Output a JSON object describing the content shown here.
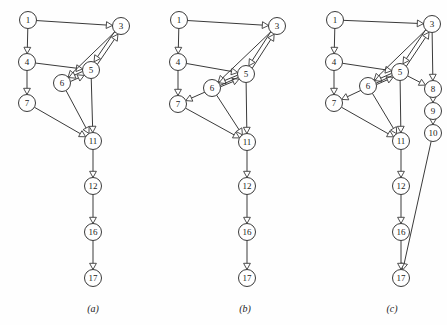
{
  "figure": {
    "background_color": "#fefefe",
    "stroke_color": "#3a3a3a",
    "node_fill": "#ffffff",
    "node_radius": 8.5,
    "width": 447,
    "height": 325
  },
  "panels": [
    {
      "id": "panel-a",
      "caption": "(a)",
      "caption_x": 93,
      "caption_y": 312,
      "nodes": [
        {
          "label": "1",
          "x": 28,
          "y": 20
        },
        {
          "label": "3",
          "x": 121,
          "y": 26
        },
        {
          "label": "4",
          "x": 27,
          "y": 62
        },
        {
          "label": "5",
          "x": 91,
          "y": 70
        },
        {
          "label": "6",
          "x": 62,
          "y": 83
        },
        {
          "label": "7",
          "x": 27,
          "y": 103
        },
        {
          "label": "11",
          "x": 93,
          "y": 141
        },
        {
          "label": "12",
          "x": 93,
          "y": 186
        },
        {
          "label": "16",
          "x": 93,
          "y": 232
        },
        {
          "label": "17",
          "x": 93,
          "y": 278
        }
      ],
      "edges": [
        {
          "from": "1",
          "to": "3"
        },
        {
          "from": "1",
          "to": "4"
        },
        {
          "from": "4",
          "to": "5"
        },
        {
          "from": "4",
          "to": "7"
        },
        {
          "from": "3",
          "to": "5"
        },
        {
          "from": "3",
          "to": "6"
        },
        {
          "from": "5",
          "to": "3"
        },
        {
          "from": "5",
          "to": "6"
        },
        {
          "from": "6",
          "to": "5"
        },
        {
          "from": "5",
          "to": "11"
        },
        {
          "from": "6",
          "to": "11"
        },
        {
          "from": "7",
          "to": "11"
        },
        {
          "from": "11",
          "to": "12"
        },
        {
          "from": "12",
          "to": "16"
        },
        {
          "from": "16",
          "to": "17"
        }
      ]
    },
    {
      "id": "panel-b",
      "caption": "(b)",
      "caption_x": 245,
      "caption_y": 312,
      "nodes": [
        {
          "label": "1",
          "x": 179,
          "y": 20
        },
        {
          "label": "3",
          "x": 277,
          "y": 26
        },
        {
          "label": "4",
          "x": 178,
          "y": 62
        },
        {
          "label": "5",
          "x": 246,
          "y": 74
        },
        {
          "label": "6",
          "x": 212,
          "y": 88
        },
        {
          "label": "7",
          "x": 178,
          "y": 104
        },
        {
          "label": "11",
          "x": 247,
          "y": 142
        },
        {
          "label": "12",
          "x": 247,
          "y": 186
        },
        {
          "label": "16",
          "x": 247,
          "y": 232
        },
        {
          "label": "17",
          "x": 247,
          "y": 278
        }
      ],
      "edges": [
        {
          "from": "1",
          "to": "3"
        },
        {
          "from": "1",
          "to": "4"
        },
        {
          "from": "4",
          "to": "5"
        },
        {
          "from": "4",
          "to": "7"
        },
        {
          "from": "3",
          "to": "5"
        },
        {
          "from": "3",
          "to": "6"
        },
        {
          "from": "5",
          "to": "3"
        },
        {
          "from": "5",
          "to": "6"
        },
        {
          "from": "6",
          "to": "5"
        },
        {
          "from": "5",
          "to": "7"
        },
        {
          "from": "5",
          "to": "11"
        },
        {
          "from": "6",
          "to": "11"
        },
        {
          "from": "7",
          "to": "11"
        },
        {
          "from": "11",
          "to": "12"
        },
        {
          "from": "12",
          "to": "16"
        },
        {
          "from": "16",
          "to": "17"
        }
      ]
    },
    {
      "id": "panel-c",
      "caption": "(c)",
      "caption_x": 392,
      "caption_y": 312,
      "nodes": [
        {
          "label": "1",
          "x": 335,
          "y": 20
        },
        {
          "label": "3",
          "x": 432,
          "y": 24
        },
        {
          "label": "4",
          "x": 334,
          "y": 62
        },
        {
          "label": "5",
          "x": 400,
          "y": 72
        },
        {
          "label": "6",
          "x": 368,
          "y": 86
        },
        {
          "label": "7",
          "x": 334,
          "y": 103
        },
        {
          "label": "8",
          "x": 433,
          "y": 89
        },
        {
          "label": "9",
          "x": 433,
          "y": 111
        },
        {
          "label": "10",
          "x": 433,
          "y": 133
        },
        {
          "label": "11",
          "x": 401,
          "y": 141
        },
        {
          "label": "12",
          "x": 401,
          "y": 186
        },
        {
          "label": "16",
          "x": 401,
          "y": 232
        },
        {
          "label": "17",
          "x": 401,
          "y": 278
        }
      ],
      "edges": [
        {
          "from": "1",
          "to": "3"
        },
        {
          "from": "1",
          "to": "4"
        },
        {
          "from": "4",
          "to": "5"
        },
        {
          "from": "4",
          "to": "7"
        },
        {
          "from": "3",
          "to": "5"
        },
        {
          "from": "3",
          "to": "6"
        },
        {
          "from": "3",
          "to": "8"
        },
        {
          "from": "5",
          "to": "3"
        },
        {
          "from": "5",
          "to": "6"
        },
        {
          "from": "6",
          "to": "5"
        },
        {
          "from": "5",
          "to": "7"
        },
        {
          "from": "5",
          "to": "8"
        },
        {
          "from": "5",
          "to": "11"
        },
        {
          "from": "6",
          "to": "11"
        },
        {
          "from": "7",
          "to": "11"
        },
        {
          "from": "8",
          "to": "9"
        },
        {
          "from": "9",
          "to": "10"
        },
        {
          "from": "10",
          "to": "17"
        },
        {
          "from": "11",
          "to": "12"
        },
        {
          "from": "12",
          "to": "16"
        },
        {
          "from": "16",
          "to": "17"
        }
      ]
    }
  ],
  "chart_data": {
    "type": "diagram",
    "subtype": "directed-graph",
    "title": "",
    "panel_count": 3,
    "panel_labels": [
      "(a)",
      "(b)",
      "(c)"
    ],
    "node_sets": {
      "(a)": [
        "1",
        "3",
        "4",
        "5",
        "6",
        "7",
        "11",
        "12",
        "16",
        "17"
      ],
      "(b)": [
        "1",
        "3",
        "4",
        "5",
        "6",
        "7",
        "11",
        "12",
        "16",
        "17"
      ],
      "(c)": [
        "1",
        "3",
        "4",
        "5",
        "6",
        "7",
        "8",
        "9",
        "10",
        "11",
        "12",
        "16",
        "17"
      ]
    },
    "edge_sets": {
      "(a)": [
        [
          "1",
          "3"
        ],
        [
          "1",
          "4"
        ],
        [
          "4",
          "5"
        ],
        [
          "4",
          "7"
        ],
        [
          "3",
          "5"
        ],
        [
          "3",
          "6"
        ],
        [
          "5",
          "3"
        ],
        [
          "5",
          "6"
        ],
        [
          "6",
          "5"
        ],
        [
          "5",
          "11"
        ],
        [
          "6",
          "11"
        ],
        [
          "7",
          "11"
        ],
        [
          "11",
          "12"
        ],
        [
          "12",
          "16"
        ],
        [
          "16",
          "17"
        ]
      ],
      "(b)": [
        [
          "1",
          "3"
        ],
        [
          "1",
          "4"
        ],
        [
          "4",
          "5"
        ],
        [
          "4",
          "7"
        ],
        [
          "3",
          "5"
        ],
        [
          "3",
          "6"
        ],
        [
          "5",
          "3"
        ],
        [
          "5",
          "6"
        ],
        [
          "6",
          "5"
        ],
        [
          "5",
          "7"
        ],
        [
          "5",
          "11"
        ],
        [
          "6",
          "11"
        ],
        [
          "7",
          "11"
        ],
        [
          "11",
          "12"
        ],
        [
          "12",
          "16"
        ],
        [
          "16",
          "17"
        ]
      ],
      "(c)": [
        [
          "1",
          "3"
        ],
        [
          "1",
          "4"
        ],
        [
          "4",
          "5"
        ],
        [
          "4",
          "7"
        ],
        [
          "3",
          "5"
        ],
        [
          "3",
          "6"
        ],
        [
          "3",
          "8"
        ],
        [
          "5",
          "3"
        ],
        [
          "5",
          "6"
        ],
        [
          "6",
          "5"
        ],
        [
          "5",
          "7"
        ],
        [
          "5",
          "8"
        ],
        [
          "5",
          "11"
        ],
        [
          "6",
          "11"
        ],
        [
          "7",
          "11"
        ],
        [
          "8",
          "9"
        ],
        [
          "9",
          "10"
        ],
        [
          "10",
          "17"
        ],
        [
          "11",
          "12"
        ],
        [
          "12",
          "16"
        ],
        [
          "16",
          "17"
        ]
      ]
    },
    "legend": [],
    "xlabel": "",
    "ylabel": ""
  }
}
